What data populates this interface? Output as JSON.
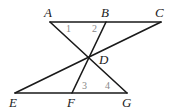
{
  "diagram": {
    "type": "geometry",
    "points": {
      "A": {
        "label": "A",
        "x": 50,
        "y": 22,
        "lx": 44,
        "ly": 17
      },
      "B": {
        "label": "B",
        "x": 106,
        "y": 22,
        "lx": 101,
        "ly": 17
      },
      "C": {
        "label": "C",
        "x": 161,
        "y": 22,
        "lx": 155,
        "ly": 17
      },
      "D": {
        "label": "D",
        "x": 89,
        "y": 58,
        "lx": 99,
        "ly": 64
      },
      "E": {
        "label": "E",
        "x": 15,
        "y": 93,
        "lx": 9,
        "ly": 107
      },
      "F": {
        "label": "F",
        "x": 72,
        "y": 93,
        "lx": 67,
        "ly": 107
      },
      "G": {
        "label": "G",
        "x": 127,
        "y": 93,
        "lx": 122,
        "ly": 107
      }
    },
    "segments": [
      [
        "A",
        "C"
      ],
      [
        "E",
        "G"
      ],
      [
        "A",
        "G"
      ],
      [
        "B",
        "F"
      ],
      [
        "C",
        "E"
      ]
    ],
    "angles": [
      {
        "label": "1",
        "x": 66,
        "y": 32
      },
      {
        "label": "2",
        "x": 92,
        "y": 32
      },
      {
        "label": "3",
        "x": 82,
        "y": 89
      },
      {
        "label": "4",
        "x": 105,
        "y": 89
      }
    ],
    "colors": {
      "line": "#1a1a1a",
      "point_label": "#222222",
      "angle_label": "#888888"
    }
  }
}
